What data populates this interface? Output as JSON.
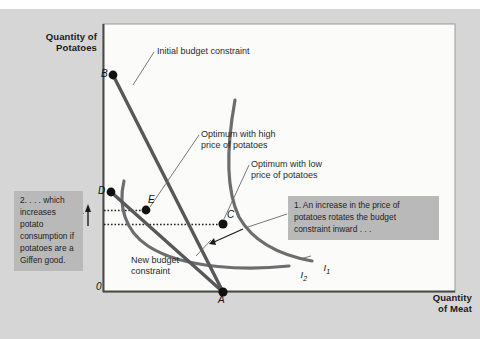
{
  "figure": {
    "axes": {
      "y_title": "Quantity of\nPotatoes",
      "x_title": "Quantity\nof Meat",
      "origin_label": "0"
    },
    "points": [
      {
        "id": "B",
        "label": "B",
        "x": 113,
        "y": 75
      },
      {
        "id": "D",
        "label": "D",
        "x": 111,
        "y": 192
      },
      {
        "id": "E",
        "label": "E",
        "x": 146,
        "y": 210
      },
      {
        "id": "C",
        "label": "C",
        "x": 222,
        "y": 224
      },
      {
        "id": "A",
        "label": "A",
        "x": 223,
        "y": 292
      }
    ],
    "annotations": {
      "initial_budget_constraint": "Initial budget constraint",
      "new_budget_constraint": "New budget\nconstraint",
      "optimum_high_price": "Optimum with high\nprice of potatoes",
      "optimum_low_price": "Optimum with low\nprice of potatoes"
    },
    "curve_labels": {
      "i1_base": "I",
      "i1_sub": "1",
      "i2_base": "I",
      "i2_sub": "2"
    },
    "callouts": [
      {
        "id": "callout-1",
        "text": "1. An increase in the price of potatoes rotates the budget constraint inward . . ."
      },
      {
        "id": "callout-2",
        "text": "2. . . . which increases potato consumption if potatoes are a Giffen good."
      }
    ],
    "colors": {
      "outer_background": "#d6d6d6",
      "plot_background": "#fbfbf9",
      "budget_line": "#58585a",
      "indifference_curve": "#6d6d6f",
      "axis": "#4a4a4a",
      "callout_background": "#b9b9b9",
      "point_fill": "#111111",
      "leader_line": "#6a6a6a",
      "dotted_guide": "#222222"
    }
  },
  "chart_data": {
    "type": "line",
    "xlabel": "Quantity of Meat",
    "ylabel": "Quantity of Potatoes",
    "grid": false,
    "legend": "none",
    "series": [
      {
        "name": "Initial budget constraint",
        "kind": "budget-line",
        "endpoints": [
          {
            "point": "B",
            "axis": "y-intercept"
          },
          {
            "point": "A",
            "axis": "x-intercept"
          }
        ]
      },
      {
        "name": "New budget constraint",
        "kind": "budget-line",
        "endpoints": [
          {
            "point": "D",
            "axis": "y-intercept"
          },
          {
            "point": "A",
            "axis": "x-intercept"
          }
        ]
      },
      {
        "name": "I1",
        "kind": "indifference-curve",
        "tangency_point": "C",
        "note": "higher indifference curve, tangent to initial budget constraint at C"
      },
      {
        "name": "I2",
        "kind": "indifference-curve",
        "tangency_point": "E",
        "note": "lower indifference curve, tangent to new budget constraint at E"
      }
    ],
    "optima": [
      {
        "label": "Optimum with low price of potatoes",
        "point": "C"
      },
      {
        "label": "Optimum with high price of potatoes",
        "point": "E"
      }
    ],
    "guides": [
      {
        "from": "E",
        "to": "y-axis",
        "style": "dotted"
      },
      {
        "from": "C",
        "to": "y-axis",
        "style": "dotted"
      },
      {
        "type": "arrow",
        "direction": "up",
        "meaning": "potato consumption rises"
      }
    ]
  }
}
